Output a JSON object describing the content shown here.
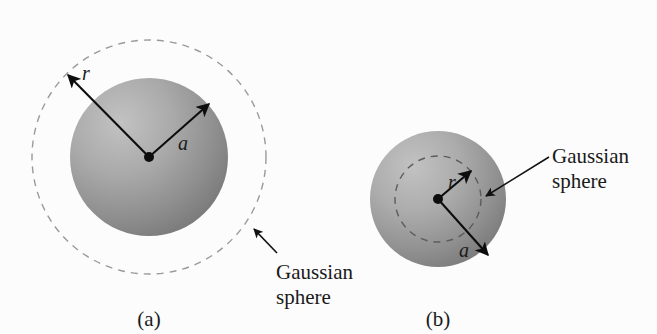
{
  "figure": {
    "background_color": "#fcfcfc",
    "panels": [
      {
        "id": "a",
        "caption": "(a)",
        "symbols": {
          "radius_outer": "r",
          "radius_sphere": "a"
        },
        "annotation_line1": "Gaussian",
        "annotation_line2": "sphere",
        "description": "Gaussian sphere outside a uniformly charged sphere",
        "sphere": {
          "cx": 149,
          "cy": 157,
          "r": 79,
          "fill_light": "#b8b8b8",
          "fill_dark": "#7d7d7d"
        },
        "gaussian_circle": {
          "cx": 149,
          "cy": 157,
          "r": 117,
          "stroke": "#9a9a9a"
        },
        "center_dot": {
          "cx": 149,
          "cy": 157,
          "r": 5
        },
        "arrow_r": {
          "x1": 149,
          "y1": 157,
          "x2": 67,
          "y2": 74
        },
        "arrow_a": {
          "x1": 149,
          "y1": 157,
          "x2": 210,
          "y2": 103
        },
        "label_r": {
          "x": 86,
          "y": 73
        },
        "label_a": {
          "x": 181,
          "y": 143
        },
        "leader": {
          "x1": 276,
          "y1": 252,
          "x2": 253,
          "y2": 229
        },
        "annotation_pos": {
          "x": 278,
          "y": 268
        },
        "caption_pos": {
          "x": 149,
          "y": 322
        }
      },
      {
        "id": "b",
        "caption": "(b)",
        "symbols": {
          "radius_inner": "r",
          "radius_sphere": "a"
        },
        "annotation_line1": "Gaussian",
        "annotation_line2": "sphere",
        "description": "Gaussian sphere inside a uniformly charged sphere",
        "sphere": {
          "cx": 438,
          "cy": 199,
          "r": 68,
          "fill_light": "#b8b8b8",
          "fill_dark": "#7d7d7d"
        },
        "gaussian_circle": {
          "cx": 438,
          "cy": 199,
          "r": 43,
          "stroke": "#5c5c5c"
        },
        "center_dot": {
          "cx": 438,
          "cy": 199,
          "r": 5
        },
        "arrow_r": {
          "x1": 438,
          "y1": 199,
          "x2": 472,
          "y2": 170
        },
        "arrow_a": {
          "x1": 438,
          "y1": 199,
          "x2": 489,
          "y2": 256
        },
        "label_r": {
          "x": 450,
          "y": 183
        },
        "label_a": {
          "x": 463,
          "y": 250
        },
        "leader": {
          "x1": 548,
          "y1": 158,
          "x2": 487,
          "y2": 195
        },
        "annotation_pos": {
          "x": 553,
          "y": 157
        },
        "caption_pos": {
          "x": 438,
          "y": 322
        }
      }
    ]
  }
}
